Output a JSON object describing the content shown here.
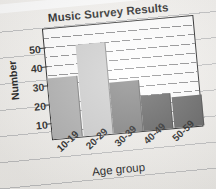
{
  "chart_data": {
    "type": "bar",
    "title": "Music Survey Results",
    "xlabel": "Age group",
    "ylabel": "Number",
    "categories": [
      "10-19",
      "20-29",
      "30-39",
      "40-49",
      "50-59"
    ],
    "values": [
      30,
      45,
      25,
      17,
      15
    ],
    "ylim": [
      0,
      55
    ],
    "yticks": [
      10,
      20,
      30,
      40,
      50
    ],
    "ytick_labels": [
      "10",
      "20",
      "30",
      "40",
      "50"
    ],
    "grid": true,
    "grid_orientation": "horizontal",
    "minor_gridline_step": 5,
    "legend": null,
    "legend_position": "none",
    "bar_colors": [
      "#a8a8a8",
      "#cacaca",
      "#787878",
      "#565656",
      "#5a5a5a"
    ]
  },
  "chart": {
    "title": "Music Survey Results",
    "y_axis": {
      "title": "Number",
      "ticks": [
        "50",
        "40",
        "30",
        "20",
        "10"
      ]
    },
    "x_axis": {
      "title": "Age group",
      "ticks": [
        "10-19",
        "20-29",
        "30-39",
        "40-49",
        "50-59"
      ]
    }
  },
  "colors": {
    "paper": "#f3f1ee",
    "rule_line": "#96989c",
    "plot_background": "#ffffff",
    "frame": "#181818",
    "gridline": "#6e6e70",
    "text": "#181818"
  }
}
